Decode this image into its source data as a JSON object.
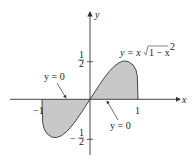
{
  "diagram": {
    "axes": {
      "x_label": "x",
      "y_label": "y",
      "x_ticks": [
        {
          "value": -1,
          "label": "−1"
        },
        {
          "value": 1,
          "label": "1"
        }
      ],
      "y_ticks": [
        {
          "value": 0.5,
          "label_num": "1",
          "label_den": "2"
        },
        {
          "value": -0.5,
          "label_num": "1",
          "label_den": "2",
          "sign": "−"
        }
      ]
    },
    "curve_label": "y = x√1 − x²",
    "curve_label_parts": {
      "lhs": "y = x",
      "radicand": "1 − x",
      "exp": "2"
    },
    "annotations": [
      {
        "text": "y = 0",
        "position": "upper-left",
        "points_to": "x-axis left of origin"
      },
      {
        "text": "y = 0",
        "position": "lower-right",
        "points_to": "x-axis right of origin"
      }
    ],
    "shading_color": "#c8c8c8",
    "line_color": "#333333"
  }
}
